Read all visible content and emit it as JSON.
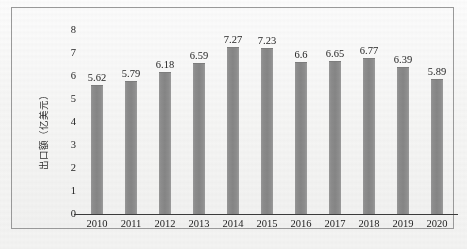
{
  "chart_data": {
    "type": "bar",
    "title": "",
    "xlabel": "",
    "ylabel": "出口额（亿美元）",
    "ylim": [
      0,
      8
    ],
    "yticks": [
      "0",
      "1",
      "2",
      "3",
      "4",
      "5",
      "6",
      "7",
      "8"
    ],
    "grid": false,
    "legend": "none",
    "bar_color": "#8a8a8a",
    "axis_color": "#3a3a3a",
    "frame_color": "#9b9b9b",
    "categories": [
      "2010",
      "2011",
      "2012",
      "2013",
      "2014",
      "2015",
      "2016",
      "2017",
      "2018",
      "2019",
      "2020"
    ],
    "values": [
      5.62,
      5.79,
      6.18,
      6.59,
      7.27,
      7.23,
      6.6,
      6.65,
      6.77,
      6.39,
      5.89
    ],
    "value_labels": [
      "5.62",
      "5.79",
      "6.18",
      "6.59",
      "7.27",
      "7.23",
      "6.6",
      "6.65",
      "6.77",
      "6.39",
      "5.89"
    ]
  },
  "caption": ""
}
